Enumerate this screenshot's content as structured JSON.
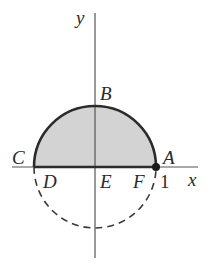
{
  "diagram": {
    "type": "semicircle-region",
    "axes": {
      "x_label": "x",
      "y_label": "y"
    },
    "points": {
      "A": "A",
      "B": "B",
      "C": "C",
      "D": "D",
      "E": "E",
      "F": "F"
    },
    "tick_label": "1",
    "colors": {
      "shade": "#d3d3d3",
      "stroke": "#2b2b2b",
      "axis": "#555555",
      "dashed": "#3a3a3a"
    }
  }
}
